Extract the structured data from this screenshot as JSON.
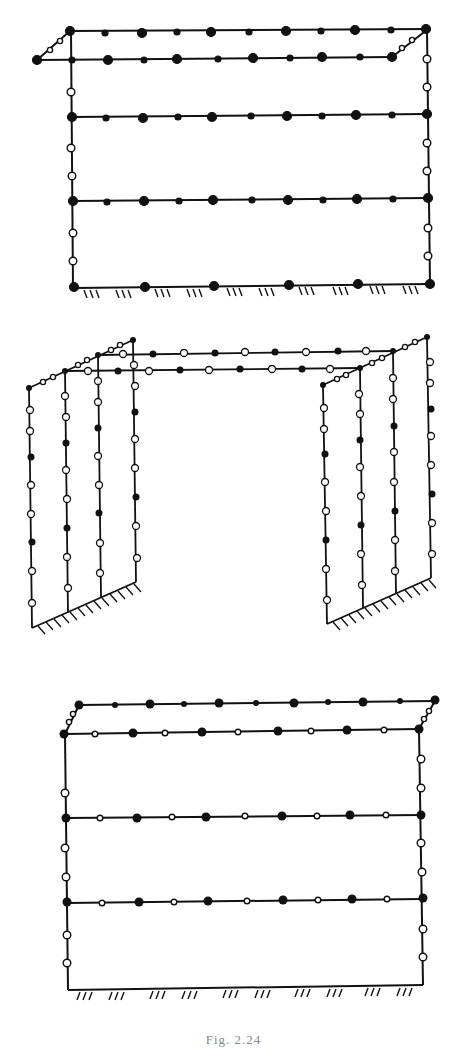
{
  "figure": {
    "caption": "Fig. 2.24",
    "stroke_color": "#111111",
    "fill_color": "#111111",
    "open_fill": "#ffffff"
  },
  "diagrams": [
    {
      "id": "frame-top",
      "description": "Planar frame with cantilevered top deck, fixed base; filled and hollow nodes",
      "members": [
        {
          "name": "top-back-beam",
          "from": [
            70,
            30
          ],
          "to": [
            428,
            28
          ]
        },
        {
          "name": "top-front-beam",
          "from": [
            37,
            60
          ],
          "to": [
            392,
            57
          ]
        },
        {
          "name": "left-column",
          "from": [
            72,
            30
          ],
          "to": [
            74,
            288
          ]
        },
        {
          "name": "right-column",
          "from": [
            428,
            28
          ],
          "to": [
            430,
            285
          ]
        },
        {
          "name": "beam-2",
          "from": [
            72,
            117
          ],
          "to": [
            427,
            114
          ]
        },
        {
          "name": "beam-3",
          "from": [
            73,
            201
          ],
          "to": [
            428,
            198
          ]
        },
        {
          "name": "base-beam",
          "from": [
            74,
            287
          ],
          "to": [
            430,
            284
          ]
        },
        {
          "name": "left-diagonal",
          "from": [
            37,
            60
          ],
          "to": [
            70,
            30
          ]
        },
        {
          "name": "right-diagonal",
          "from": [
            392,
            57
          ],
          "to": [
            428,
            28
          ]
        }
      ],
      "ground": {
        "y": 288,
        "x_start": 80,
        "x_end": 425
      }
    },
    {
      "id": "frame-middle",
      "description": "Two 3D wall frames joined by double top beams; fixed inclined bases",
      "ground_left": {
        "from": [
          34,
          628
        ],
        "to": [
          143,
          580
        ]
      },
      "ground_right": {
        "from": [
          326,
          624
        ],
        "to": [
          432,
          579
        ]
      }
    },
    {
      "id": "frame-bottom",
      "description": "Planar frame with offset top deck, fixed base; filled and hollow nodes",
      "ground": {
        "y": 990,
        "x_start": 75,
        "x_end": 415
      }
    }
  ]
}
